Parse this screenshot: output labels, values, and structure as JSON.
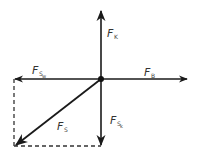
{
  "diagram": {
    "type": "force-vector-diagram",
    "colors": {
      "line": "#1a1a1a",
      "text": "#333333",
      "background": "#ffffff"
    },
    "origin": {
      "x": 101,
      "y": 79
    },
    "vectors": [
      {
        "id": "F_K",
        "label_main": "F",
        "label_sub": "K",
        "direction": "up"
      },
      {
        "id": "F_B",
        "label_main": "F",
        "label_sub": "B",
        "direction": "right"
      },
      {
        "id": "F_Sw",
        "label_main": "F",
        "label_sub": "S",
        "label_subsub": "w",
        "direction": "left"
      },
      {
        "id": "F_Sk",
        "label_main": "F",
        "label_sub": "S",
        "label_subsub": "k",
        "direction": "down"
      },
      {
        "id": "F_S",
        "label_main": "F",
        "label_sub": "S",
        "direction": "down-left"
      }
    ]
  }
}
